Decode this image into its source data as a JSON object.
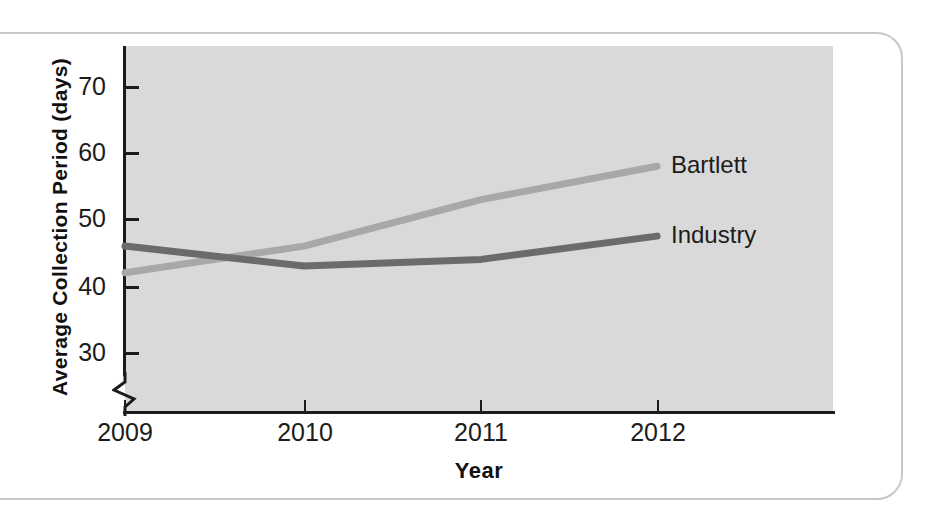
{
  "chart_data": {
    "type": "line",
    "title": "",
    "xlabel": "Year",
    "ylabel": "Average Collection Period (days)",
    "x": [
      "2009",
      "2010",
      "2011",
      "2012"
    ],
    "categories": [
      "2009",
      "2010",
      "2011",
      "2012"
    ],
    "xtick_labels": [
      "2009",
      "2010",
      "2011",
      "2012"
    ],
    "ytick_labels": [
      "30",
      "40",
      "50",
      "60",
      "70"
    ],
    "ytick_values": [
      30,
      40,
      50,
      60,
      70
    ],
    "ylim": [
      25,
      75
    ],
    "y_axis_break": true,
    "grid": false,
    "legend_position": "right-inline-labels",
    "plot_background": "#d9d9d9",
    "series": [
      {
        "name": "Bartlett",
        "values": [
          42.0,
          46.0,
          53.0,
          58.0
        ],
        "color": "#a8a8a8",
        "label": "Bartlett"
      },
      {
        "name": "Industry",
        "values": [
          46.0,
          43.0,
          44.0,
          47.5
        ],
        "color": "#6b6b6b",
        "label": "Industry"
      }
    ]
  },
  "axes": {
    "y_title": "Average Collection Period (days)",
    "x_title": "Year",
    "y_ticks": [
      {
        "label": "70",
        "value": 70
      },
      {
        "label": "60",
        "value": 60
      },
      {
        "label": "50",
        "value": 50
      },
      {
        "label": "40",
        "value": 40
      },
      {
        "label": "30",
        "value": 30
      }
    ],
    "x_ticks": [
      {
        "label": "2009",
        "value": 2009
      },
      {
        "label": "2010",
        "value": 2010
      },
      {
        "label": "2011",
        "value": 2011
      },
      {
        "label": "2012",
        "value": 2012
      }
    ]
  },
  "series_labels": {
    "bartlett": "Bartlett",
    "industry": "Industry"
  },
  "colors": {
    "bartlett_line": "#a8a8a8",
    "industry_line": "#6b6b6b",
    "plot_background": "#d9d9d9",
    "axis": "#1c1c1c",
    "frame_border": "#c8c8c8"
  }
}
